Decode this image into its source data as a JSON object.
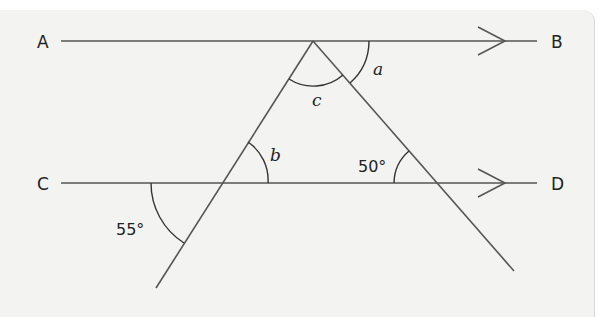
{
  "figure": {
    "type": "parallel-lines-with-transversals",
    "points": {
      "A": "A",
      "B": "B",
      "C": "C",
      "D": "D"
    },
    "lines": [
      {
        "name": "AB",
        "parallel_marker": "single-arrow"
      },
      {
        "name": "CD",
        "parallel_marker": "single-arrow"
      }
    ],
    "angles": {
      "a": "a",
      "b": "b",
      "c": "c",
      "given_50": "50°",
      "given_55": "55°"
    },
    "colors": {
      "background": "#f3f3f2",
      "line": "#555555",
      "text": "#222222"
    }
  }
}
